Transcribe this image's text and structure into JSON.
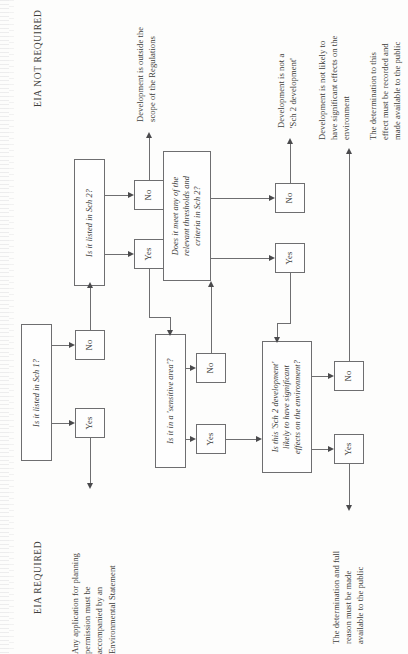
{
  "page": {
    "orientation": "rotated-90-ccw",
    "ink_color": "#6e6e70",
    "paper_color": "#fdfdfc"
  },
  "headings": {
    "not_required": "EIA NOT REQUIRED",
    "required": "EIA REQUIRED"
  },
  "decisions": {
    "sch1": "Is it listed in Sch 1?",
    "sch2": "Is it listed in Sch 2?",
    "sensitive": "Is it in a 'sensitive area'?",
    "thresholds": "Does it meet any of the\nrelevant thresholds and\ncriteria in Sch 2?",
    "significant": "Is this 'Sch 2 development'\nlikely to have significant\neffects on the environment?"
  },
  "answers": {
    "yes": "Yes",
    "no": "No"
  },
  "outcomes": {
    "es_required": "Any application for planning\npermission must be\naccompanied by an\nEnvironmental Statement",
    "outside_scope": "Development is outside the\nscope of the Regulations",
    "not_sch2": "Development is not a\n'Sch 2 development'",
    "not_significant": "Development is not likely to\nhave significant effects on the\nenvironment",
    "record_determination": "The determination to this\neffect must be recorded and\nmade available to the public",
    "publish_determination": "The determination and full\nreason must be made\navailable to the public"
  }
}
